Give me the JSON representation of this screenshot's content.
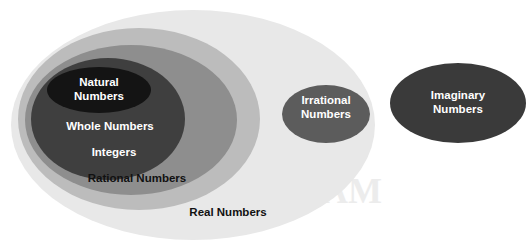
{
  "diagram": {
    "type": "nested-venn-ellipses",
    "background_color": "#ffffff",
    "width": 530,
    "height": 245
  },
  "sets": [
    {
      "key": "real",
      "label": "Real Numbers",
      "color": "#e8e8e8",
      "text_color": "#111111",
      "cx": 193,
      "cy": 125,
      "rx": 182,
      "ry": 115,
      "label_x": 228,
      "label_y": 213,
      "font_size": 11.5,
      "lines": [
        "Real Numbers"
      ]
    },
    {
      "key": "rational",
      "label": "Rational Numbers",
      "color": "#bcbcbc",
      "text_color": "#111111",
      "cx": 139,
      "cy": 119,
      "rx": 121,
      "ry": 91,
      "label_x": 137,
      "label_y": 179,
      "font_size": 11.5,
      "lines": [
        "Rational Numbers"
      ]
    },
    {
      "key": "integers",
      "label": "Integers",
      "color": "#8e8e8e",
      "text_color": "#ffffff",
      "cx": 131,
      "cy": 120,
      "rx": 106,
      "ry": 75,
      "label_x": 114,
      "label_y": 153,
      "font_size": 11.5,
      "lines": [
        "Integers"
      ]
    },
    {
      "key": "whole",
      "label": "Whole Numbers",
      "color": "#3f3f3f",
      "text_color": "#ffffff",
      "cx": 108,
      "cy": 119,
      "rx": 77,
      "ry": 61,
      "label_x": 110,
      "label_y": 127,
      "font_size": 11.5,
      "lines": [
        "Whole Numbers"
      ]
    },
    {
      "key": "natural",
      "label": "Natural Numbers",
      "color": "#141414",
      "text_color": "#ffffff",
      "cx": 99,
      "cy": 90,
      "rx": 52,
      "ry": 23,
      "label_x": 99,
      "label_y": 90,
      "font_size": 11.5,
      "lines": [
        "Natural",
        "Numbers"
      ]
    },
    {
      "key": "irrational",
      "label": "Irrational Numbers",
      "color": "#5c5c5c",
      "text_color": "#ffffff",
      "cx": 326,
      "cy": 114,
      "rx": 44,
      "ry": 29,
      "label_x": 326,
      "label_y": 108,
      "font_size": 11.5,
      "lines": [
        "Irrational",
        "Numbers"
      ]
    },
    {
      "key": "imaginary",
      "label": "Imaginary Numbers",
      "color": "#3a3a3a",
      "text_color": "#ffffff",
      "cx": 458,
      "cy": 103,
      "rx": 68,
      "ry": 40,
      "label_x": 458,
      "label_y": 103,
      "font_size": 11.5,
      "lines": [
        "Imaginary",
        "Numbers"
      ]
    }
  ],
  "watermark": {
    "visible": true,
    "color": "#dedede",
    "lines": [
      {
        "text": "VENN",
        "x": 292,
        "y": 165,
        "font_size": 36
      },
      {
        "text": "DIAGRAM",
        "x": 292,
        "y": 203,
        "font_size": 36
      }
    ]
  }
}
